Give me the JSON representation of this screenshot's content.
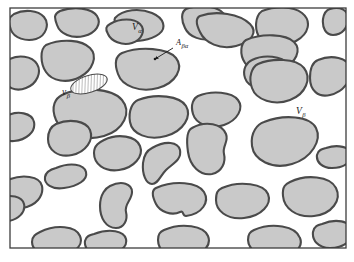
{
  "figure": {
    "frame": {
      "x": 10,
      "y": 8,
      "width": 336,
      "height": 240,
      "stroke": "#3d3d3d",
      "stroke_width": 1.3
    },
    "background_color": "#ffffff",
    "phase_fill_color": "#c9c9c9",
    "phase_outline_color": "#4a4a4a",
    "phase_outline_width": 2.1,
    "label_color": "#1a1a1a"
  },
  "labels": [
    {
      "id": "v-alpha",
      "name": "volume-alpha-label",
      "base": "V",
      "subscript": "α",
      "x": 132,
      "y": 30,
      "size": "main",
      "description": "Volume of the alpha phase (continuous white matrix)"
    },
    {
      "id": "a-beta-alpha",
      "name": "interfacial-area-label",
      "base": "A",
      "subscript": "βα",
      "x": 176,
      "y": 45,
      "size": "small",
      "description": "Interfacial area between beta and alpha phases"
    },
    {
      "id": "v-beta-small",
      "name": "averaging-volume-label",
      "base": "v",
      "subscript": "β",
      "x": 62,
      "y": 95,
      "size": "main",
      "description": "Local averaging volume within the beta phase"
    },
    {
      "id": "v-beta",
      "name": "volume-beta-label",
      "base": "V",
      "subscript": "β",
      "x": 296,
      "y": 114,
      "size": "main",
      "description": "Volume of the beta phase (gray inclusions)"
    }
  ],
  "pointer": {
    "name": "interface-pointer-arrow",
    "from_x": 173,
    "from_y": 48,
    "to_x": 155,
    "to_y": 59,
    "head_x": 155,
    "head_y": 59,
    "stroke": "#1a1a1a",
    "stroke_width": 0.9
  },
  "hatched_region": {
    "name": "hatched-averaging-ellipse",
    "cx": 89,
    "cy": 84,
    "rx": 19,
    "ry": 8.5,
    "rotation": -18,
    "fill": "#ffffff",
    "stroke": "#4a4a4a",
    "stroke_width": 1.0,
    "hatch_angle_deg": 20,
    "hatch_spacing": 3,
    "hatch_color": "#4a4a4a"
  },
  "blobs": [
    {
      "name": "beta-blob-01",
      "d": "M 14 14 C 24 9, 38 10, 44 17 C 50 24, 46 36, 36 39 C 26 42, 14 38, 11 30 C 8 22, 8 18, 14 14 Z"
    },
    {
      "name": "beta-blob-02",
      "d": "M 60 11 C 74 6, 92 8, 97 16 C 102 24, 96 33, 84 36 C 72 39, 60 34, 57 25 C 54 17, 54 14, 60 11 Z"
    },
    {
      "name": "beta-blob-03",
      "d": "M 115 18 C 123 9, 140 8, 152 13 C 164 18, 167 28, 159 34 C 151 40, 136 43, 125 39 C 117 36, 114 33, 118 29 C 122 25, 112 24, 115 18 Z"
    },
    {
      "name": "beta-blob-04",
      "d": "M 186 9 C 200 4, 218 6, 224 14 C 230 22, 226 34, 214 38 C 202 42, 189 37, 185 28 C 181 20, 181 12, 186 9 Z"
    },
    {
      "name": "beta-blob-05",
      "d": "M 262 11 C 275 6, 293 6, 302 13 C 312 21, 309 34, 296 41 C 283 48, 266 46, 260 38 C 254 30, 255 16, 262 11 Z"
    },
    {
      "name": "beta-blob-06",
      "d": "M 330 9 C 340 6, 348 10, 348 18 C 348 28, 342 35, 333 35 C 326 35, 322 28, 323 19 C 324 13, 326 10, 330 9 Z"
    },
    {
      "name": "beta-blob-07",
      "d": "M 46 45 C 62 38, 82 40, 90 48 C 98 56, 93 70, 80 77 C 67 84, 52 81, 46 72 C 40 63, 40 49, 46 45 Z"
    },
    {
      "name": "beta-blob-08",
      "d": "M 122 53 C 140 46, 168 48, 176 58 C 184 68, 176 83, 158 88 C 140 93, 122 86, 118 74 C 114 63, 116 56, 122 53 Z"
    },
    {
      "name": "beta-blob-09",
      "d": "M 200 16 C 216 10, 240 14, 250 24 C 258 32, 252 42, 236 46 C 220 50, 205 43, 200 32 C 196 24, 196 18, 200 16 Z"
    },
    {
      "name": "beta-blob-10",
      "d": "M 246 40 C 262 33, 286 34, 294 42 C 302 50, 296 63, 282 69 C 268 75, 251 72, 245 63 C 239 54, 241 43, 246 40 Z"
    },
    {
      "name": "beta-blob-11",
      "d": "M 110 24 C 120 18, 134 18, 140 24 C 146 30, 142 40, 132 43 C 122 46, 111 41, 108 34 C 105 29, 106 26, 110 24 Z"
    },
    {
      "name": "beta-blob-12",
      "d": "M 8 60 C 18 54, 32 56, 37 64 C 42 72, 37 84, 26 88 C 16 92, 6 88, 5 79 C 4 70, 4 62, 8 60 Z"
    },
    {
      "name": "beta-blob-13",
      "d": "M 252 60 C 264 54, 282 56, 288 64 C 294 72, 288 84, 275 88 C 262 92, 248 87, 245 78 C 242 69, 247 62, 252 60 Z"
    },
    {
      "name": "beta-blob-14",
      "d": "M 258 64 C 272 58, 296 58, 304 68 C 312 78, 306 94, 290 100 C 274 106, 256 100, 252 88 C 248 77, 252 67, 258 64 Z"
    },
    {
      "name": "beta-blob-15",
      "d": "M 318 60 C 332 54, 348 58, 350 68 C 352 80, 344 92, 330 95 C 318 98, 310 90, 310 78 C 310 68, 313 62, 318 60 Z"
    },
    {
      "name": "beta-blob-16",
      "d": "M 62 95 C 80 86, 112 88, 122 100 C 132 112, 124 130, 104 136 C 84 142, 62 134, 56 120 C 50 106, 56 98, 62 95 Z"
    },
    {
      "name": "beta-blob-17",
      "d": "M 138 100 C 156 93, 180 96, 186 106 C 192 116, 184 131, 166 136 C 148 141, 132 134, 130 122 C 128 110, 133 102, 138 100 Z"
    },
    {
      "name": "beta-blob-18",
      "d": "M 198 96 C 212 90, 232 92, 238 100 C 244 108, 238 120, 224 125 C 210 130, 196 124, 193 114 C 190 104, 194 98, 198 96 Z"
    },
    {
      "name": "beta-blob-19",
      "d": "M 56 124 C 70 118, 86 121, 90 130 C 94 140, 86 152, 72 155 C 58 158, 48 150, 48 139 C 48 130, 52 126, 56 124 Z"
    },
    {
      "name": "beta-blob-20",
      "d": "M 104 140 C 118 133, 136 136, 140 146 C 144 156, 134 168, 119 170 C 104 172, 94 164, 94 153 C 94 145, 100 142, 104 140 Z"
    },
    {
      "name": "beta-blob-21",
      "d": "M 152 148 C 166 140, 178 142, 180 150 C 182 160, 172 164, 166 170 C 160 176, 158 184, 152 184 C 146 184, 142 174, 143 163 C 144 153, 148 150, 152 148 Z"
    },
    {
      "name": "beta-blob-22",
      "d": "M 192 128 C 206 120, 222 124, 226 134 C 229 142, 222 146, 224 154 C 226 162, 222 172, 212 174 C 200 176, 190 166, 188 152 C 186 138, 188 130, 192 128 Z"
    },
    {
      "name": "beta-blob-23",
      "d": "M 264 122 C 284 114, 310 116, 316 128 C 322 140, 312 158, 292 164 C 272 170, 254 160, 252 146 C 250 132, 258 124, 264 122 Z"
    },
    {
      "name": "beta-blob-24",
      "d": "M 326 148 C 338 144, 350 147, 351 154 C 352 162, 344 168, 332 168 C 322 168, 316 162, 317 155 C 318 150, 322 149, 326 148 Z"
    },
    {
      "name": "beta-blob-25",
      "d": "M 56 168 C 70 162, 84 164, 86 172 C 88 180, 78 186, 64 188 C 52 190, 44 184, 45 177 C 46 171, 52 169, 56 168 Z"
    },
    {
      "name": "beta-blob-26",
      "d": "M 8 180 C 22 174, 40 176, 42 186 C 44 196, 36 206, 22 208 C 10 210, 2 202, 2 192 C 2 184, 4 181, 8 180 Z"
    },
    {
      "name": "beta-blob-27",
      "d": "M 110 186 C 122 180, 132 184, 132 192 C 132 200, 124 204, 126 212 C 128 220, 124 228, 116 228 C 106 228, 100 218, 100 206 C 100 194, 106 188, 110 186 Z"
    },
    {
      "name": "beta-blob-28",
      "d": "M 156 188 C 174 180, 198 182, 204 192 C 210 202, 202 214, 186 216 C 182 216, 184 210, 180 212 C 172 216, 160 212, 156 204 C 152 196, 152 190, 156 188 Z"
    },
    {
      "name": "beta-blob-29",
      "d": "M 222 188 C 240 180, 264 184, 268 194 C 272 204, 262 216, 244 218 C 226 220, 216 210, 216 200 C 216 192, 218 190, 222 188 Z"
    },
    {
      "name": "beta-blob-30",
      "d": "M 290 182 C 306 174, 330 176, 336 188 C 342 200, 332 214, 314 216 C 296 218, 284 208, 283 196 C 282 186, 286 184, 290 182 Z"
    },
    {
      "name": "beta-blob-31",
      "d": "M 40 232 C 56 224, 76 226, 80 236 C 84 246, 74 254, 58 256 C 42 258, 32 250, 32 242 C 32 236, 36 234, 40 232 Z"
    },
    {
      "name": "beta-blob-32",
      "d": "M 94 234 C 110 228, 124 231, 126 239 C 128 249, 116 254, 102 255 C 90 256, 84 248, 85 241 C 86 236, 90 235, 94 234 Z"
    },
    {
      "name": "beta-blob-33",
      "d": "M 164 230 C 182 222, 204 226, 208 236 C 212 246, 202 256, 184 258 C 168 260, 158 250, 158 240 C 158 234, 160 232, 164 230 Z"
    },
    {
      "name": "beta-blob-34",
      "d": "M 254 230 C 272 222, 296 226, 300 238 C 304 248, 292 258, 274 258 C 258 258, 248 248, 248 240 C 248 234, 250 232, 254 230 Z"
    },
    {
      "name": "beta-blob-35",
      "d": "M 322 224 C 336 218, 350 221, 352 230 C 354 240, 344 248, 330 248 C 318 248, 312 240, 313 232 C 314 226, 318 225, 322 224 Z"
    },
    {
      "name": "beta-blob-36",
      "d": "M 6 116 C 18 110, 32 113, 34 122 C 36 132, 26 140, 14 141 C 4 142, 0 134, 0 126 C 0 119, 2 117, 6 116 Z"
    },
    {
      "name": "beta-blob-37",
      "d": "M 0 198 C 10 194, 22 196, 24 204 C 26 212, 18 220, 8 221 C 2 222, 0 216, 0 208 Z"
    }
  ],
  "axes": {
    "visible": false
  },
  "legend": {
    "visible": false
  }
}
